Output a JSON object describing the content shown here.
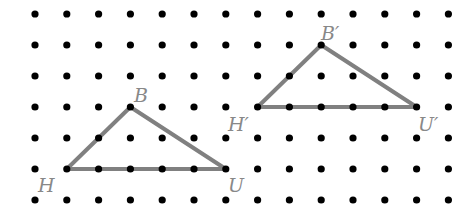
{
  "grid": {
    "columns": 14,
    "rows": 7,
    "dot_color": "#000000"
  },
  "triangles": [
    {
      "name": "original",
      "stroke_color": "#808080",
      "vertices": [
        {
          "label": "H",
          "col": 1,
          "row": 5
        },
        {
          "label": "B",
          "col": 3,
          "row": 3
        },
        {
          "label": "U",
          "col": 6,
          "row": 5
        }
      ]
    },
    {
      "name": "image",
      "stroke_color": "#808080",
      "vertices": [
        {
          "label": "H′",
          "col": 7,
          "row": 3
        },
        {
          "label": "B′",
          "col": 9,
          "row": 1
        },
        {
          "label": "U′",
          "col": 12,
          "row": 3
        }
      ]
    }
  ],
  "labels": {
    "H": "H",
    "B": "B",
    "U": "U",
    "H_prime": "H′",
    "B_prime": "B′",
    "U_prime": "U′"
  }
}
